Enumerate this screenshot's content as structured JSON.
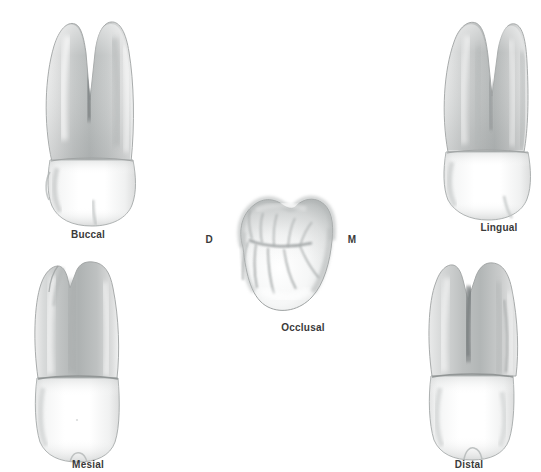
{
  "figure": {
    "background_color": "#ffffff",
    "ink_color": "#3a3a3a",
    "palette": {
      "enamel_light": "#fdfdfd",
      "enamel_mid": "#eceded",
      "root_light": "#e4e5e5",
      "root_mid": "#c9cbcb",
      "root_dark": "#a8acac",
      "groove_dark": "#8e9293",
      "outline": "#9a9e9e"
    }
  },
  "views": [
    {
      "id": "buccal",
      "label": "Buccal",
      "label_x": 88,
      "label_y": 229,
      "description": "Two roots with deep developmental groove, crown with buccal cusp"
    },
    {
      "id": "occlusal",
      "label": "Occlusal",
      "label_x": 303,
      "label_y": 322,
      "description": "Chewing surface with central groove and branching fissures"
    },
    {
      "id": "lingual",
      "label": "Lingual",
      "label_x": 499,
      "label_y": 222,
      "description": "Lingual aspect showing root trunk and lingual cusp"
    },
    {
      "id": "mesial",
      "label": "Mesial",
      "label_x": 88,
      "label_y": 459,
      "description": "Mesial aspect with mesial developmental depression"
    },
    {
      "id": "distal",
      "label": "Distal",
      "label_x": 469,
      "label_y": 459,
      "description": "Distal aspect showing root furcation"
    }
  ],
  "orientation_markers": [
    {
      "id": "distal-marker",
      "label": "D",
      "x": 209,
      "y": 239
    },
    {
      "id": "mesial-marker",
      "label": "M",
      "x": 352,
      "y": 239
    }
  ]
}
